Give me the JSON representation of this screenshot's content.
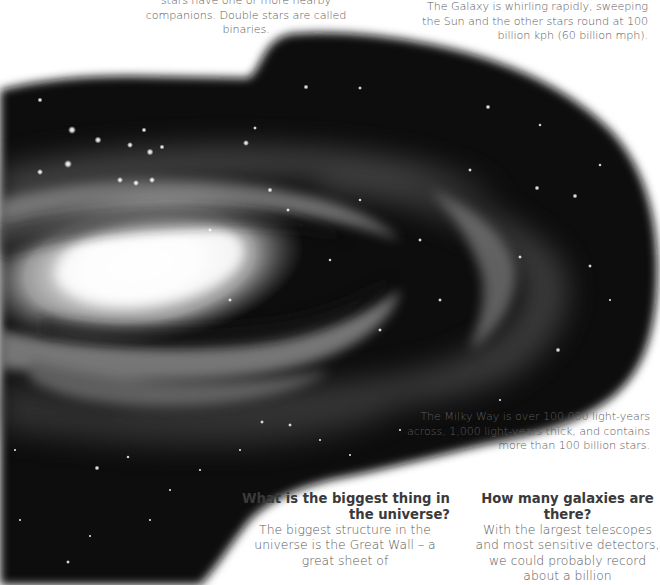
{
  "captions": {
    "binaries": "stars have one or more nearby companions. Double stars are called binaries.",
    "whirling": "The Galaxy is whirling rapidly, sweeping the Sun and the other stars round at 100 billion kph (60 billion mph).",
    "milky_way": "The Milky Way is over 100,000 light-years across, 1,000 light-years thick, and contains more than 100 billion stars."
  },
  "qa": [
    {
      "question": "What is the biggest thing in the universe?",
      "answer": "The biggest structure in the universe is the Great Wall – a great sheet of"
    },
    {
      "question": "How many galaxies are there?",
      "answer": "With the largest telescopes and most sensitive detectors, we could probably record about a billion"
    }
  ],
  "image": {
    "subject": "spiral-galaxy-illustration",
    "background": "#ffffff",
    "space_color": "#0d0d0d"
  }
}
